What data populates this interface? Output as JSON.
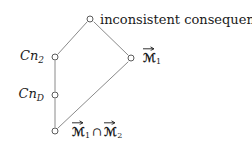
{
  "figure": {
    "type": "lattice-hasse-diagram",
    "background_color": "#ffffff",
    "line_color": "#8a8a8a",
    "node_stroke_color": "#5a5a5a",
    "text_color": "#1a1a1a"
  },
  "nodes": [
    {
      "id": "top",
      "name": "inconsistent-consequence",
      "x": 90,
      "y": 19,
      "label": "inconsistent consequence",
      "label_side": "right"
    },
    {
      "id": "cn2",
      "name": "cn-2",
      "x": 55,
      "y": 57,
      "label": "Cn",
      "subscript": "2",
      "label_side": "left"
    },
    {
      "id": "cnd",
      "name": "cn-d",
      "x": 55,
      "y": 95,
      "label": "Cn",
      "subscript": "D",
      "label_side": "left"
    },
    {
      "id": "m1",
      "name": "m-1",
      "x": 131,
      "y": 58,
      "label_side": "right"
    },
    {
      "id": "bottom",
      "name": "m1-intersect-m2",
      "x": 55,
      "y": 131,
      "label_side": "right"
    }
  ],
  "edges": [
    {
      "name": "edge-top-cn2",
      "from": "top",
      "to": "cn2"
    },
    {
      "name": "edge-top-m1",
      "from": "top",
      "to": "m1"
    },
    {
      "name": "edge-cn2-cnd",
      "from": "cn2",
      "to": "cnd"
    },
    {
      "name": "edge-cnd-bottom",
      "from": "cnd",
      "to": "bottom"
    },
    {
      "name": "edge-bottom-m1",
      "from": "bottom",
      "to": "m1"
    }
  ],
  "labels": {
    "top_text": "inconsistent consequence",
    "cn2_base": "Cn",
    "cn2_sub": "2",
    "cnd_base": "Cn",
    "cnd_sub": "D",
    "m1_base": "ℳ",
    "m1_sub": "1",
    "bottom_first_base": "ℳ",
    "bottom_first_sub": "1",
    "bottom_operator": "∩",
    "bottom_second_base": "ℳ",
    "bottom_second_sub": "2"
  }
}
